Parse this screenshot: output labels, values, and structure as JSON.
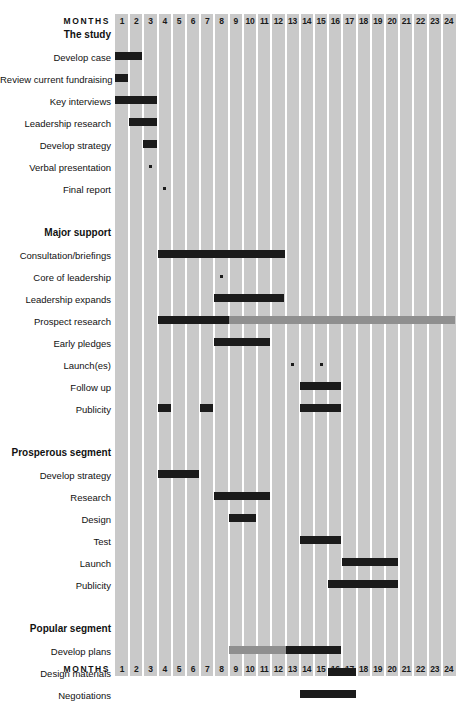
{
  "header": {
    "months_word": "MONTHS",
    "month_labels": [
      "1",
      "2",
      "3",
      "4",
      "5",
      "6",
      "7",
      "8",
      "9",
      "10",
      "11",
      "12",
      "13",
      "14",
      "15",
      "16",
      "17",
      "18",
      "19",
      "20",
      "21",
      "22",
      "23",
      "24"
    ]
  },
  "footer": {
    "months_word": "MONTHS",
    "month_labels": [
      "1",
      "2",
      "3",
      "4",
      "5",
      "6",
      "7",
      "8",
      "9",
      "10",
      "11",
      "12",
      "13",
      "14",
      "15",
      "16",
      "17",
      "18",
      "19",
      "20",
      "21",
      "22",
      "23",
      "24"
    ]
  },
  "colors": {
    "grid_background": "#c9c9c9",
    "grid_line": "#ffffff",
    "bar_solid": "#1b1b1b",
    "bar_shaded": "#8f8f8f",
    "page_background": "#ffffff",
    "text": "#111111"
  },
  "rows": [
    {
      "type": "section",
      "label": "The study"
    },
    {
      "type": "task",
      "label": "Develop case"
    },
    {
      "type": "task",
      "label": "Review current fundraising"
    },
    {
      "type": "task",
      "label": "Key interviews"
    },
    {
      "type": "task",
      "label": "Leadership research"
    },
    {
      "type": "task",
      "label": "Develop strategy"
    },
    {
      "type": "task",
      "label": "Verbal presentation"
    },
    {
      "type": "task",
      "label": "Final report"
    },
    {
      "type": "spacer",
      "label": ""
    },
    {
      "type": "section",
      "label": "Major support"
    },
    {
      "type": "task",
      "label": "Consultation/briefings"
    },
    {
      "type": "task",
      "label": "Core of leadership"
    },
    {
      "type": "task",
      "label": "Leadership expands"
    },
    {
      "type": "task",
      "label": "Prospect research"
    },
    {
      "type": "task",
      "label": "Early pledges"
    },
    {
      "type": "task",
      "label": "Launch(es)"
    },
    {
      "type": "task",
      "label": "Follow up"
    },
    {
      "type": "task",
      "label": "Publicity"
    },
    {
      "type": "spacer",
      "label": ""
    },
    {
      "type": "section",
      "label": "Prosperous segment"
    },
    {
      "type": "task",
      "label": "Develop strategy"
    },
    {
      "type": "task",
      "label": "Research"
    },
    {
      "type": "task",
      "label": "Design"
    },
    {
      "type": "task",
      "label": "Test"
    },
    {
      "type": "task",
      "label": "Launch"
    },
    {
      "type": "task",
      "label": "Publicity"
    },
    {
      "type": "spacer",
      "label": ""
    },
    {
      "type": "section",
      "label": "Popular segment"
    },
    {
      "type": "task",
      "label": "Develop plans"
    },
    {
      "type": "task",
      "label": "Design materials"
    },
    {
      "type": "task",
      "label": "Negotiations"
    },
    {
      "type": "task",
      "label": "Test materials"
    },
    {
      "type": "task",
      "label": "Launch"
    },
    {
      "type": "task",
      "label": "Publicity"
    }
  ],
  "chart_data": {
    "type": "bar",
    "title": "",
    "xlabel": "MONTHS",
    "ylabel": "",
    "x": [
      1,
      2,
      3,
      4,
      5,
      6,
      7,
      8,
      9,
      10,
      11,
      12,
      13,
      14,
      15,
      16,
      17,
      18,
      19,
      20,
      21,
      22,
      23,
      24
    ],
    "xlim": [
      1,
      24
    ],
    "grid": true,
    "legend": [
      {
        "name": "Active work",
        "color": "#1b1b1b"
      },
      {
        "name": "Ongoing / background",
        "color": "#8f8f8f"
      },
      {
        "name": "Milestone",
        "color": "#1b1b1b"
      }
    ],
    "sections": [
      {
        "name": "The study",
        "tasks": [
          {
            "name": "Develop case",
            "bars": [
              {
                "start": 1,
                "end": 2,
                "style": "solid"
              }
            ],
            "milestones": []
          },
          {
            "name": "Review current fundraising",
            "bars": [
              {
                "start": 1,
                "end": 1,
                "style": "solid"
              }
            ],
            "milestones": []
          },
          {
            "name": "Key interviews",
            "bars": [
              {
                "start": 1,
                "end": 3,
                "style": "solid"
              }
            ],
            "milestones": []
          },
          {
            "name": "Leadership research",
            "bars": [
              {
                "start": 2,
                "end": 3,
                "style": "solid"
              }
            ],
            "milestones": []
          },
          {
            "name": "Develop strategy",
            "bars": [
              {
                "start": 3,
                "end": 3,
                "style": "solid"
              }
            ],
            "milestones": []
          },
          {
            "name": "Verbal presentation",
            "bars": [],
            "milestones": [
              3
            ]
          },
          {
            "name": "Final report",
            "bars": [],
            "milestones": [
              4
            ]
          }
        ]
      },
      {
        "name": "Major support",
        "tasks": [
          {
            "name": "Consultation/briefings",
            "bars": [
              {
                "start": 4,
                "end": 12,
                "style": "solid"
              }
            ],
            "milestones": []
          },
          {
            "name": "Core of leadership",
            "bars": [],
            "milestones": [
              8
            ]
          },
          {
            "name": "Leadership expands",
            "bars": [
              {
                "start": 8,
                "end": 12,
                "style": "solid"
              }
            ],
            "milestones": []
          },
          {
            "name": "Prospect research",
            "bars": [
              {
                "start": 4,
                "end": 9,
                "style": "solid"
              },
              {
                "start": 9,
                "end": 24,
                "style": "shaded"
              }
            ],
            "milestones": []
          },
          {
            "name": "Early pledges",
            "bars": [
              {
                "start": 8,
                "end": 11,
                "style": "solid"
              }
            ],
            "milestones": []
          },
          {
            "name": "Launch(es)",
            "bars": [],
            "milestones": [
              13,
              15
            ]
          },
          {
            "name": "Follow up",
            "bars": [
              {
                "start": 14,
                "end": 16,
                "style": "solid"
              }
            ],
            "milestones": []
          },
          {
            "name": "Publicity",
            "bars": [
              {
                "start": 4,
                "end": 4,
                "style": "solid"
              },
              {
                "start": 7,
                "end": 7,
                "style": "solid"
              },
              {
                "start": 14,
                "end": 16,
                "style": "solid"
              }
            ],
            "milestones": []
          }
        ]
      },
      {
        "name": "Prosperous segment",
        "tasks": [
          {
            "name": "Develop strategy",
            "bars": [
              {
                "start": 4,
                "end": 6,
                "style": "solid"
              }
            ],
            "milestones": []
          },
          {
            "name": "Research",
            "bars": [
              {
                "start": 8,
                "end": 11,
                "style": "solid"
              }
            ],
            "milestones": []
          },
          {
            "name": "Design",
            "bars": [
              {
                "start": 9,
                "end": 10,
                "style": "solid"
              }
            ],
            "milestones": []
          },
          {
            "name": "Test",
            "bars": [
              {
                "start": 14,
                "end": 16,
                "style": "solid"
              }
            ],
            "milestones": []
          },
          {
            "name": "Launch",
            "bars": [
              {
                "start": 17,
                "end": 20,
                "style": "solid"
              }
            ],
            "milestones": []
          },
          {
            "name": "Publicity",
            "bars": [
              {
                "start": 16,
                "end": 20,
                "style": "solid"
              }
            ],
            "milestones": []
          }
        ]
      },
      {
        "name": "Popular segment",
        "tasks": [
          {
            "name": "Develop plans",
            "bars": [
              {
                "start": 9,
                "end": 13,
                "style": "shaded"
              },
              {
                "start": 13,
                "end": 16,
                "style": "solid"
              }
            ],
            "milestones": []
          },
          {
            "name": "Design materials",
            "bars": [
              {
                "start": 16,
                "end": 17,
                "style": "solid"
              }
            ],
            "milestones": []
          },
          {
            "name": "Negotiations",
            "bars": [
              {
                "start": 14,
                "end": 17,
                "style": "solid"
              }
            ],
            "milestones": []
          },
          {
            "name": "Test materials",
            "bars": [
              {
                "start": 16,
                "end": 19,
                "style": "solid"
              }
            ],
            "milestones": []
          },
          {
            "name": "Launch",
            "bars": [
              {
                "start": 20,
                "end": 24,
                "style": "solid"
              }
            ],
            "milestones": []
          },
          {
            "name": "Publicity",
            "bars": [
              {
                "start": 19,
                "end": 24,
                "style": "solid"
              }
            ],
            "milestones": []
          }
        ]
      }
    ]
  }
}
